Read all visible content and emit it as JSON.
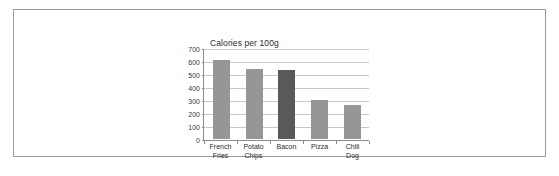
{
  "document": {
    "border_color": "#9a9a9a",
    "background": "#ffffff"
  },
  "chart_data": {
    "type": "bar",
    "title": "Calories per 100g",
    "xlabel": "",
    "ylabel": "",
    "categories": [
      "French Fries",
      "Potato Chips",
      "Bacon",
      "Pizza",
      "Chili Dog"
    ],
    "values": [
      607,
      542,
      533,
      299,
      260
    ],
    "ylim": [
      0,
      700
    ],
    "yticks": [
      0,
      100,
      200,
      300,
      400,
      500,
      600,
      700
    ],
    "ytick_labels": [
      "0",
      "100",
      "200",
      "300",
      "400",
      "500",
      "600",
      "700"
    ],
    "grid": true,
    "grid_axis": "y",
    "legend": false,
    "bar_color": "#969696",
    "highlight_color": "#595959",
    "highlight_index": 2,
    "series": [
      {
        "name": "Calories per 100g",
        "values": [
          607,
          542,
          533,
          299,
          260
        ]
      }
    ]
  }
}
